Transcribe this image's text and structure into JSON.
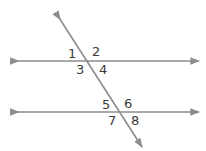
{
  "figure": {
    "background_color": "#ffffff",
    "width": 206,
    "height": 151,
    "line_color": "#8c8c8c",
    "label_color": "#3b3b3b",
    "line_width": 1.6
  },
  "lines": {
    "top_parallel": {
      "name": "top-parallel-line",
      "x1": 11,
      "y1": 61,
      "x2": 199,
      "y2": 61,
      "arrows": "both"
    },
    "bottom_parallel": {
      "name": "bottom-parallel-line",
      "x1": 11,
      "y1": 112,
      "x2": 199,
      "y2": 112,
      "arrows": "both"
    },
    "transversal": {
      "name": "transversal-line",
      "x1": 56,
      "y1": 13,
      "x2": 142,
      "y2": 147,
      "arrows": "both"
    }
  },
  "intersections": {
    "upper": {
      "x": 87,
      "y": 61
    },
    "lower": {
      "x": 118,
      "y": 112
    }
  },
  "angle_labels": [
    {
      "id": "angle-1",
      "text": "1",
      "x": 68,
      "y": 47
    },
    {
      "id": "angle-2",
      "text": "2",
      "x": 92,
      "y": 45
    },
    {
      "id": "angle-3",
      "text": "3",
      "x": 76,
      "y": 63
    },
    {
      "id": "angle-4",
      "text": "4",
      "x": 99,
      "y": 63
    },
    {
      "id": "angle-5",
      "text": "5",
      "x": 102,
      "y": 98
    },
    {
      "id": "angle-6",
      "text": "6",
      "x": 124,
      "y": 97
    },
    {
      "id": "angle-7",
      "text": "7",
      "x": 108,
      "y": 114
    },
    {
      "id": "angle-8",
      "text": "8",
      "x": 131,
      "y": 114
    }
  ]
}
